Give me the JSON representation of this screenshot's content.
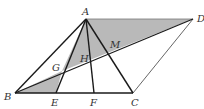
{
  "diagram": {
    "type": "geometry-figure",
    "colors": {
      "line": "#1a1a1a",
      "thin_line": "#555555",
      "shade": "#b9b9b9"
    },
    "points": {
      "A": {
        "label": "A",
        "x": 86,
        "y": 19
      },
      "D": {
        "label": "D",
        "x": 193,
        "y": 19
      },
      "B": {
        "label": "B",
        "x": 15,
        "y": 93
      },
      "C": {
        "label": "C",
        "x": 133,
        "y": 93
      },
      "E": {
        "label": "E",
        "x": 56,
        "y": 93
      },
      "F": {
        "label": "F",
        "x": 94,
        "y": 93
      },
      "G": {
        "label": "G",
        "x": 62,
        "y": 71
      },
      "H": {
        "label": "H",
        "x": 90,
        "y": 62
      },
      "M": {
        "label": "M",
        "x": 113,
        "y": 52
      }
    },
    "labels": {
      "A": "A",
      "B": "B",
      "C": "C",
      "D": "D",
      "E": "E",
      "F": "F",
      "G": "G",
      "H": "H",
      "M": "M"
    },
    "shaded_regions": [
      "triangle A-D-G",
      "triangle B-E-G"
    ],
    "segments": [
      "AB",
      "AC",
      "AE",
      "AF",
      "BC",
      "CD",
      "AD",
      "BD"
    ]
  }
}
